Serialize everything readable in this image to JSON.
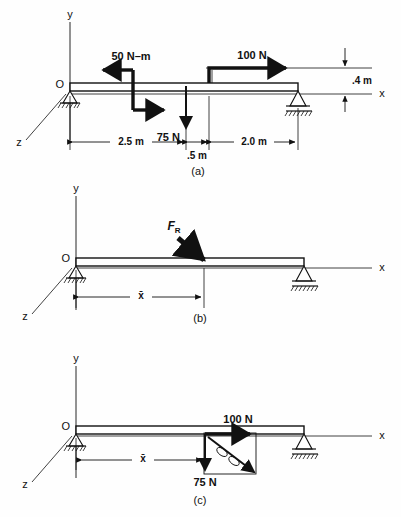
{
  "figure": {
    "panels": [
      {
        "id": "a",
        "caption": "(a)",
        "axes": {
          "y": "y",
          "x": "x",
          "z": "z",
          "origin": "O"
        },
        "loads": [
          {
            "name": "couple",
            "label": "50 N–m",
            "position_m": 0.0,
            "type": "couple"
          },
          {
            "name": "point-load-75",
            "label": "75 N",
            "position_m": 2.5,
            "type": "force-down"
          },
          {
            "name": "point-load-100",
            "label": "100 N",
            "position_m": 3.0,
            "type": "force-right",
            "offset_label": ".4 m"
          }
        ],
        "dimensions": [
          {
            "label": "2.5 m",
            "value_m": 2.5
          },
          {
            "label": ".5 m",
            "value_m": 0.5
          },
          {
            "label": "2.0 m",
            "value_m": 2.0
          },
          {
            "label": ".4 m",
            "value_m": 0.4
          }
        ]
      },
      {
        "id": "b",
        "caption": "(b)",
        "axes": {
          "y": "y",
          "x": "x",
          "z": "z",
          "origin": "O"
        },
        "loads": [
          {
            "name": "resultant-force",
            "label": "F",
            "sublabel": "R",
            "type": "force-resultant"
          }
        ],
        "dimensions": [
          {
            "label": "x̄",
            "value_m": null
          }
        ]
      },
      {
        "id": "c",
        "caption": "(c)",
        "axes": {
          "y": "y",
          "x": "x",
          "z": "z",
          "origin": "O"
        },
        "loads": [
          {
            "name": "component-100",
            "label": "100 N",
            "type": "force-right"
          },
          {
            "name": "component-75",
            "label": "75 N",
            "type": "force-down"
          },
          {
            "name": "resultant-couple",
            "label": "",
            "type": "moment-vector"
          }
        ],
        "dimensions": [
          {
            "label": "x̄",
            "value_m": null
          }
        ]
      }
    ],
    "colors": {
      "ink": "#111111",
      "paper": "#fefefe"
    }
  }
}
